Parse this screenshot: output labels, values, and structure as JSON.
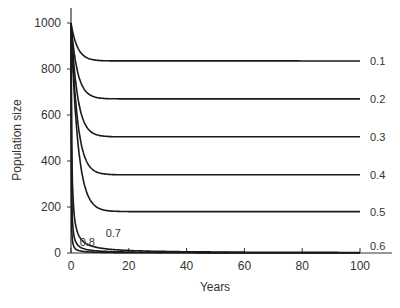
{
  "chart_data": {
    "type": "line",
    "title": "",
    "xlabel": "Years",
    "ylabel": "Population size",
    "xlim": [
      0,
      100
    ],
    "ylim": [
      0,
      1000
    ],
    "xticks": [
      0,
      20,
      40,
      60,
      80,
      100
    ],
    "yticks": [
      0,
      200,
      400,
      600,
      800,
      1000
    ],
    "grid": false,
    "legend": "inline labels at line ends",
    "initial_value": 1000,
    "series": [
      {
        "name": "0.1",
        "equilibrium": 835,
        "rate": 0.45,
        "label_pos": "end"
      },
      {
        "name": "0.2",
        "equilibrium": 670,
        "rate": 0.45,
        "label_pos": "end"
      },
      {
        "name": "0.3",
        "equilibrium": 505,
        "rate": 0.45,
        "label_pos": "end"
      },
      {
        "name": "0.4",
        "equilibrium": 340,
        "rate": 0.45,
        "label_pos": "end"
      },
      {
        "name": "0.5",
        "equilibrium": 180,
        "rate": 0.42,
        "label_pos": "end"
      },
      {
        "name": "0.6",
        "equilibrium": 0,
        "hyperbolic": 0.045,
        "label_pos": "end"
      },
      {
        "name": "0.7",
        "equilibrium": 0,
        "hyperbolic": 0.12,
        "label_pos": "inside",
        "label_x": 12,
        "label_y": 70
      },
      {
        "name": "0.8",
        "equilibrium": 0,
        "hyperbolic": 0.35,
        "label_pos": "inside",
        "label_x": 3,
        "label_y": 30
      }
    ]
  }
}
